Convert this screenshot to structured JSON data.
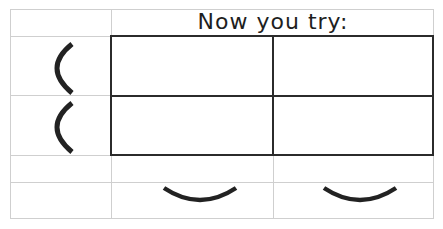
{
  "title": "Now you try:",
  "grid": {
    "outer": {
      "left": 10,
      "top": 9,
      "right": 434,
      "bottom": 218
    },
    "columns_x": [
      10,
      111,
      273,
      434
    ],
    "rows_y": [
      9,
      36,
      95,
      155,
      182,
      218
    ],
    "light_line_color": "#cfcfcf",
    "dark_box_color": "#2b2b2b"
  },
  "answer_box": {
    "left": 111,
    "top": 36,
    "right": 434,
    "bottom": 155,
    "rows": 2,
    "cols": 2
  },
  "row_labels": [
    {
      "icon": "left-parenthesis-arc",
      "row": 1
    },
    {
      "icon": "left-parenthesis-arc",
      "row": 2
    }
  ],
  "column_labels": [
    {
      "icon": "bottom-smile-arc",
      "col": 1
    },
    {
      "icon": "bottom-smile-arc",
      "col": 2
    }
  ],
  "colors": {
    "arc": "#222222",
    "text": "#1e1e1e"
  }
}
